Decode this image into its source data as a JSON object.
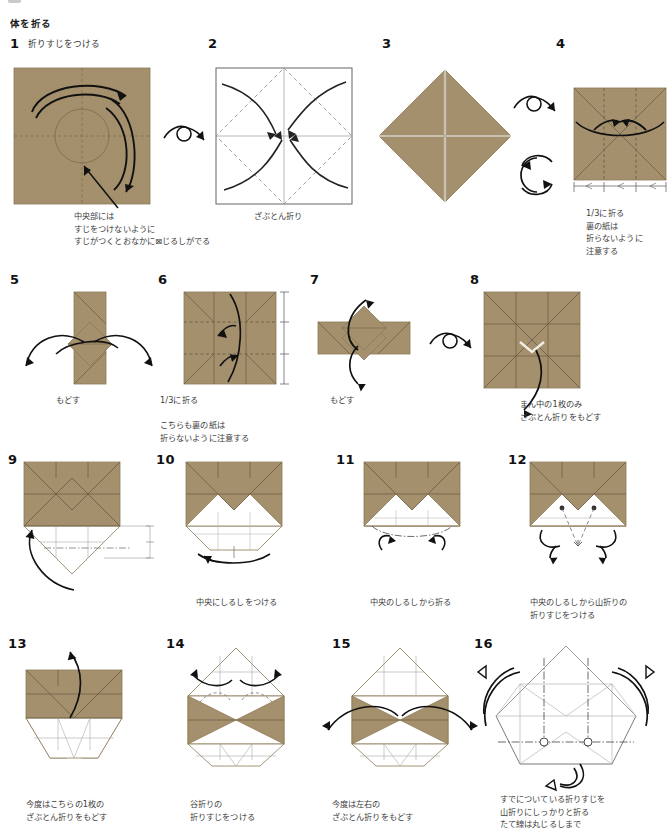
{
  "document": {
    "section_title": "体を折る",
    "paper_color": "#a4906c",
    "paper_color_dark": "#988563",
    "line_color": "#5a5147",
    "white_face": "#ffffff",
    "crease_gray": "#9a9a9a",
    "arrow_color": "#1a1a1a",
    "caption_color": "#3d3d3d"
  },
  "steps": [
    {
      "number": "1",
      "heading": "折りすじをつける",
      "caption": "中央部には\nすじをつけないように\nすじがつくとおなかに⊠じるしがでる",
      "figure": "square-brown-spiral-arrows-center-circle"
    },
    {
      "number": "2",
      "heading": "",
      "caption": "ざぶとん折り",
      "figure": "square-white-diamond-dashed-four-arrows-to-center"
    },
    {
      "number": "3",
      "heading": "",
      "caption": "",
      "figure": "diamond-brown-cross-creases"
    },
    {
      "number": "4",
      "heading": "",
      "caption": "1/3に折る\n裏の紙は\n折らないように\n注意する",
      "figure": "square-brown-two-vertical-thirds-arrows-inward"
    },
    {
      "number": "5",
      "heading": "",
      "caption": "もどす",
      "figure": "vertical-band-with-diamond-unfold-arrows"
    },
    {
      "number": "6",
      "heading": "",
      "caption": "1/3に折る\n\nこちらも裏の紙は\n折らないように注意する",
      "figure": "square-brown-thirds-horizontal-arrows-scale"
    },
    {
      "number": "7",
      "heading": "",
      "caption": "もどす",
      "figure": "horizontal-band-with-diamond-unfold-arrows"
    },
    {
      "number": "8",
      "heading": "",
      "caption": "まん中の1枚のみ\nざぶとん折りをもどす",
      "figure": "square-brown-grid-diagonals-pull-arrow"
    },
    {
      "number": "9",
      "heading": "",
      "caption": "",
      "figure": "brown-top-white-diamond-bottom-measure-arrow"
    },
    {
      "number": "10",
      "heading": "",
      "caption": "中央にしるしをつける",
      "figure": "brown-top-white-fan-bottom-pinch-arrow"
    },
    {
      "number": "11",
      "heading": "",
      "caption": "中央のしるしから折る",
      "figure": "brown-top-white-fan-two-fold-arrows"
    },
    {
      "number": "12",
      "heading": "",
      "caption": "中央のしるしから山折りの\n折りすじをつける",
      "figure": "brown-top-white-fan-mountain-creases"
    },
    {
      "number": "13",
      "heading": "",
      "caption": "今度はこちらの1枚の\nざぶとん折りをもどす",
      "figure": "brown-body-white-lower-pull-arrow"
    },
    {
      "number": "14",
      "heading": "",
      "caption": "谷折りの\n折りすじをつける",
      "figure": "white-peak-brown-bowtie-two-outward-arrows"
    },
    {
      "number": "15",
      "heading": "",
      "caption": "今度は左右の\nざぶとん折りをもどす",
      "figure": "white-peak-brown-side-triangles-outward-arrows"
    },
    {
      "number": "16",
      "heading": "",
      "caption": "すでについている折りすじを\n山折りにしっかりと折る\nたて線は丸じるしまで",
      "figure": "white-octagon-crease-pattern-mountain-arrows"
    }
  ]
}
